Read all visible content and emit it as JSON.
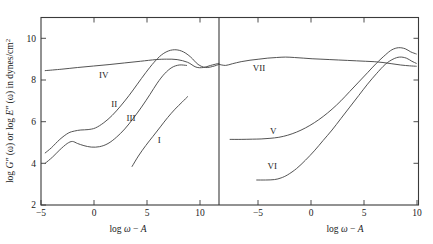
{
  "figure": {
    "ylabel_parts": {
      "p1": "log",
      "p2": "G″",
      "p3": "(ω) or log",
      "p4": "E″",
      "p5": "(ω) in dynes/cm",
      "p6": "2"
    },
    "ylabel_full": "log G″ (ω) or log E″ (ω) in dynes/cm²",
    "y_ticks": [
      "10",
      "8",
      "6",
      "4",
      "2"
    ],
    "x_axis_title_parts": {
      "a": "log",
      "b": "ω",
      "c": "−",
      "d": "A"
    },
    "x_axis_title_full": "log ω − A",
    "left_x_ticks": [
      "−5",
      "0",
      "5",
      "10"
    ],
    "right_x_ticks": [
      "−5",
      "0",
      "5",
      "10"
    ],
    "curve_labels": {
      "I": "I",
      "II": "II",
      "III": "III",
      "IV": "IV",
      "V": "V",
      "VI": "VI",
      "VII": "VII"
    }
  },
  "chart_data": {
    "type": "line",
    "title": "",
    "subtitle": "",
    "xlabel": "log ω − A",
    "ylabel": "log G″ (ω) or log E″ (ω) in dynes/cm²",
    "ylim": [
      2,
      11
    ],
    "ytick_values": [
      2,
      4,
      6,
      8,
      10
    ],
    "grid": false,
    "legend": "inline-curve-labels",
    "panels": [
      {
        "panel": "left",
        "xlim": [
          -5,
          12
        ],
        "xtick_values": [
          -5,
          0,
          5,
          10
        ],
        "series": [
          {
            "name": "I",
            "label_at": {
              "x": 6.3,
              "y": 5.1
            },
            "x": [
              3.7,
              4.3,
              5.0,
              5.7,
              6.4,
              7.1,
              7.8,
              8.5,
              9.0
            ],
            "y": [
              3.85,
              4.35,
              4.85,
              5.3,
              5.75,
              6.2,
              6.6,
              6.95,
              7.2
            ]
          },
          {
            "name": "II",
            "label_at": {
              "x": 2.0,
              "y": 6.85
            },
            "x": [
              -4.6,
              -4.0,
              -3.2,
              -2.4,
              -1.8,
              -1.2,
              -0.5,
              0.2,
              1.0,
              1.8,
              2.6,
              3.4,
              4.2,
              5.0,
              5.8,
              6.5,
              7.2,
              7.9,
              8.6,
              9.3,
              10.0,
              10.7,
              11.4,
              12.0
            ],
            "y": [
              4.5,
              4.75,
              5.15,
              5.45,
              5.55,
              5.6,
              5.62,
              5.7,
              5.95,
              6.3,
              6.75,
              7.25,
              7.8,
              8.35,
              8.85,
              9.2,
              9.4,
              9.45,
              9.35,
              9.1,
              8.75,
              8.6,
              8.65,
              8.75
            ]
          },
          {
            "name": "III",
            "label_at": {
              "x": 3.6,
              "y": 6.2
            },
            "x": [
              -4.6,
              -3.9,
              -3.2,
              -2.5,
              -2.0,
              -1.5,
              -0.9,
              -0.2,
              0.6,
              1.4,
              2.2,
              3.0,
              3.8,
              4.6,
              5.4,
              6.1,
              6.8,
              7.5,
              8.2,
              8.9
            ],
            "y": [
              4.0,
              4.3,
              4.65,
              4.95,
              5.05,
              4.95,
              4.85,
              4.78,
              4.8,
              4.95,
              5.25,
              5.65,
              6.15,
              6.7,
              7.3,
              7.85,
              8.3,
              8.6,
              8.72,
              8.7
            ]
          },
          {
            "name": "IV",
            "label_at": {
              "x": 1.0,
              "y": 8.25
            },
            "x": [
              -4.6,
              -3.0,
              -1.5,
              0.0,
              1.5,
              3.0,
              4.5,
              6.0,
              7.0,
              8.0,
              9.0,
              9.8,
              10.5,
              11.2,
              12.0
            ],
            "y": [
              8.45,
              8.52,
              8.6,
              8.67,
              8.74,
              8.82,
              8.9,
              8.98,
              9.0,
              8.98,
              8.85,
              8.62,
              8.6,
              8.7,
              8.8
            ]
          }
        ]
      },
      {
        "panel": "right",
        "xlim": [
          -8,
          10
        ],
        "xtick_values": [
          -5,
          0,
          5,
          10
        ],
        "series": [
          {
            "name": "V",
            "label_at": {
              "x": -3.1,
              "y": 5.55
            },
            "x": [
              -7.0,
              -6.0,
              -5.0,
              -4.2,
              -3.4,
              -2.6,
              -1.8,
              -1.0,
              -0.2,
              0.6,
              1.4,
              2.2,
              3.0,
              3.8,
              4.6,
              5.4,
              6.2,
              7.0,
              7.6,
              8.2,
              8.8,
              9.3,
              9.8
            ],
            "y": [
              5.15,
              5.15,
              5.16,
              5.17,
              5.2,
              5.25,
              5.35,
              5.5,
              5.7,
              5.95,
              6.25,
              6.6,
              7.0,
              7.45,
              7.9,
              8.35,
              8.8,
              9.2,
              9.45,
              9.55,
              9.5,
              9.35,
              9.25
            ]
          },
          {
            "name": "VI",
            "label_at": {
              "x": -3.2,
              "y": 3.85
            },
            "x": [
              -4.6,
              -3.8,
              -3.0,
              -2.4,
              -1.8,
              -1.0,
              -0.2,
              0.6,
              1.4,
              2.2,
              3.0,
              3.8,
              4.6,
              5.4,
              6.2,
              7.0,
              7.7,
              8.3,
              8.9,
              9.4,
              9.8
            ],
            "y": [
              3.2,
              3.2,
              3.22,
              3.3,
              3.45,
              3.75,
              4.15,
              4.6,
              5.1,
              5.6,
              6.15,
              6.7,
              7.25,
              7.8,
              8.3,
              8.75,
              9.0,
              9.1,
              9.05,
              8.9,
              8.8
            ]
          },
          {
            "name": "VII",
            "label_at": {
              "x": -4.4,
              "y": 8.6
            },
            "x": [
              -8.0,
              -7.4,
              -6.8,
              -6.0,
              -5.2,
              -4.4,
              -3.6,
              -2.8,
              -2.0,
              -1.2,
              -0.4,
              0.4,
              1.2,
              2.0,
              2.8,
              3.6,
              4.4,
              5.2,
              6.0,
              6.8,
              7.6,
              8.4,
              9.2,
              9.8
            ],
            "y": [
              8.75,
              8.7,
              8.78,
              8.88,
              8.95,
              9.0,
              9.05,
              9.08,
              9.1,
              9.08,
              9.05,
              9.02,
              9.0,
              8.98,
              8.96,
              8.94,
              8.92,
              8.9,
              8.88,
              8.84,
              8.78,
              8.72,
              8.68,
              8.66
            ]
          }
        ]
      }
    ]
  }
}
